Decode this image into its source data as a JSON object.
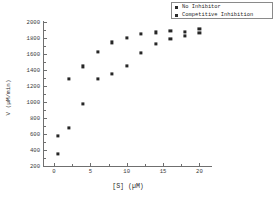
{
  "chart_data": {
    "type": "scatter",
    "title": "",
    "xlabel": "[S]  (µM)",
    "ylabel": "V  (µM/min)",
    "xlim": [
      -1.5,
      23
    ],
    "ylim": [
      200,
      2050
    ],
    "xticks": [
      0,
      5,
      10,
      15,
      20
    ],
    "xtick_labels": [
      "0",
      "5",
      "10",
      "15",
      "20"
    ],
    "yticks": [
      200,
      400,
      600,
      800,
      1000,
      1200,
      1400,
      1600,
      1800,
      2000
    ],
    "ytick_labels": [
      "200",
      "400",
      "600",
      "800",
      "1000",
      "1200",
      "1400",
      "1600",
      "1800",
      "2000"
    ],
    "grid": false,
    "legend_position": "top-right",
    "series": [
      {
        "name": "No Inhibitor",
        "marker": "square",
        "color": "#262626",
        "x": [
          0.5,
          2,
          4,
          6,
          8,
          10,
          12,
          14,
          16,
          18,
          20
        ],
        "y": [
          580,
          1290,
          1445,
          1625,
          1745,
          1805,
          1850,
          1870,
          1890,
          1880,
          1910
        ]
      },
      {
        "name": "Competitive Inhibition",
        "marker": "square",
        "color": "#262626",
        "x": [
          0.5,
          2,
          4,
          6,
          8,
          10,
          12,
          14,
          16,
          18,
          20
        ],
        "y": [
          350,
          680,
          980,
          1285,
          1350,
          1450,
          1615,
          1730,
          1790,
          1830,
          1860
        ]
      }
    ]
  },
  "legend": {
    "items": [
      {
        "label": "No Inhibitor",
        "marker": "square"
      },
      {
        "label": "Competitive Inhibition",
        "marker": "square"
      }
    ]
  }
}
